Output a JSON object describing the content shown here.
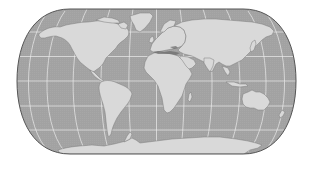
{
  "map": {
    "projection": "Natural Earth (pseudocylindrical, rounded corners)",
    "colors": {
      "ocean": "#a2a2a2",
      "land": "#d9d9d9",
      "land_shadow": "#7a7a7a",
      "graticule": "#f2f2f2",
      "outline": "#5a5a5a",
      "background": "#ffffff"
    },
    "graticule": {
      "parallels_deg": [
        -60,
        -30,
        0,
        30,
        60
      ],
      "meridians_deg": [
        -150,
        -120,
        -90,
        -60,
        -30,
        0,
        30,
        60,
        90,
        120,
        150
      ]
    },
    "continents": [
      "North America",
      "South America",
      "Greenland",
      "Europe",
      "Africa",
      "Asia",
      "Australia",
      "Antarctica"
    ]
  }
}
